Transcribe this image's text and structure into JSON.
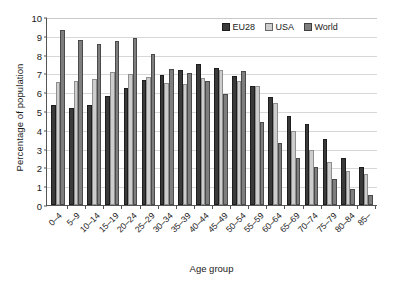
{
  "chart_data": {
    "type": "bar",
    "title": "",
    "xlabel": "Age group",
    "ylabel": "Percentage of population",
    "ylim": [
      0,
      10
    ],
    "yticks": [
      0,
      1,
      2,
      3,
      4,
      5,
      6,
      7,
      8,
      9,
      10
    ],
    "grid": true,
    "legend_position": "top-right",
    "categories": [
      "0–4",
      "5–9",
      "10–14",
      "15–19",
      "20–24",
      "25–29",
      "30–34",
      "35–39",
      "40–44",
      "45–49",
      "50–54",
      "55–59",
      "60–64",
      "65–69",
      "70–74",
      "75–79",
      "80–84",
      "85–"
    ],
    "series": [
      {
        "name": "EU28",
        "color": "#3a3a3a",
        "values": [
          5.3,
          5.15,
          5.3,
          5.8,
          6.25,
          6.65,
          6.9,
          7.2,
          7.5,
          7.3,
          6.85,
          6.35,
          5.75,
          4.75,
          4.3,
          3.5,
          2.5,
          2.0
        ]
      },
      {
        "name": "USA",
        "color": "#cdcdcd",
        "values": [
          6.55,
          6.6,
          6.7,
          7.05,
          6.95,
          6.8,
          6.5,
          6.45,
          6.75,
          7.2,
          6.6,
          6.35,
          5.4,
          3.95,
          2.95,
          2.3,
          1.8,
          1.65
        ]
      },
      {
        "name": "World",
        "color": "#7e7e7e",
        "values": [
          9.3,
          8.8,
          8.55,
          8.75,
          8.9,
          8.05,
          7.25,
          7.0,
          6.6,
          5.9,
          7.15,
          4.4,
          3.3,
          2.5,
          2.0,
          1.4,
          0.85,
          0.55
        ]
      }
    ]
  },
  "legend": {
    "items": [
      {
        "label": "EU28"
      },
      {
        "label": "USA"
      },
      {
        "label": "World"
      }
    ]
  }
}
